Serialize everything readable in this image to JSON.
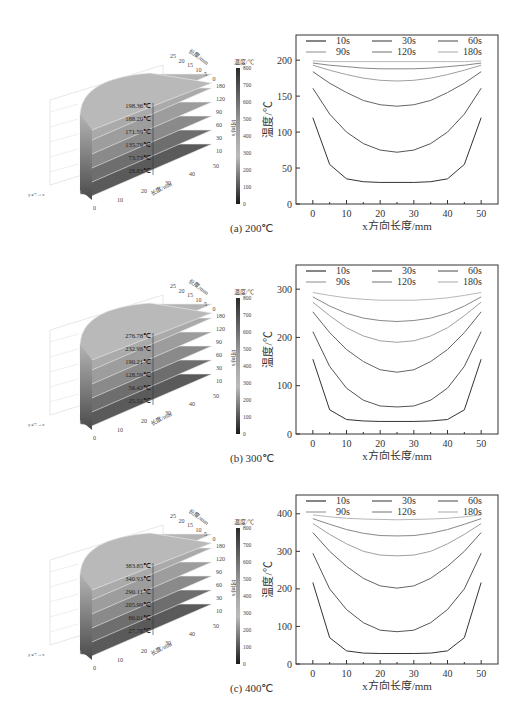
{
  "figure": {
    "panels": [
      {
        "id": "a",
        "caption": "(a) 200℃"
      },
      {
        "id": "b",
        "caption": "(b) 300℃"
      },
      {
        "id": "c",
        "caption": "(c) 400℃"
      }
    ]
  },
  "chart_data": [
    {
      "type": "line",
      "title": "(a) 200℃",
      "xlabel": "x方向长度/mm",
      "ylabel": "温度/℃",
      "xlim": [
        -5,
        55
      ],
      "ylim": [
        0,
        235
      ],
      "xticks": [
        0,
        10,
        20,
        30,
        40,
        50
      ],
      "yticks": [
        0,
        50,
        100,
        150,
        200
      ],
      "legend": [
        "10s",
        "30s",
        "60s",
        "90s",
        "120s",
        "180s"
      ],
      "x": [
        0,
        5,
        10,
        15,
        20,
        25,
        30,
        35,
        40,
        45,
        50
      ],
      "series": [
        {
          "name": "10s",
          "values": [
            120,
            55,
            35,
            31,
            30,
            30,
            30,
            31,
            35,
            55,
            120
          ]
        },
        {
          "name": "30s",
          "values": [
            161,
            125,
            100,
            84,
            75,
            72,
            75,
            84,
            100,
            125,
            161
          ]
        },
        {
          "name": "60s",
          "values": [
            184,
            168,
            155,
            144,
            138,
            136,
            138,
            144,
            155,
            168,
            184
          ]
        },
        {
          "name": "90s",
          "values": [
            193,
            186,
            180,
            175,
            172,
            171,
            172,
            175,
            180,
            186,
            193
          ]
        },
        {
          "name": "120s",
          "values": [
            196,
            193,
            191,
            189,
            188,
            188,
            188,
            189,
            191,
            193,
            196
          ]
        },
        {
          "name": "180s",
          "values": [
            199,
            198,
            198,
            198,
            198,
            198,
            198,
            198,
            198,
            198,
            199
          ]
        }
      ],
      "inset_3d": {
        "temperature_labels": [
          "198.36℃",
          "188.20℃",
          "171.59℃",
          "135.79℃",
          "73.73℃",
          "28.83℃"
        ],
        "time_axis_label": "时间/s",
        "time_ticks": [
          10,
          30,
          60,
          90,
          120,
          180
        ],
        "length_axis_label": "长度/mm",
        "length_ticks": [
          0,
          10,
          20,
          30,
          40,
          50
        ],
        "width_axis_label": "长度/mm",
        "width_ticks": [
          0,
          5,
          10,
          15,
          20,
          25
        ],
        "colorbar_label": "温度/℃",
        "colorbar_ticks": [
          0,
          100,
          200,
          300,
          400,
          500,
          600,
          700,
          800
        ]
      }
    },
    {
      "type": "line",
      "title": "(b) 300℃",
      "xlabel": "x方向长度/mm",
      "ylabel": "温度/℃",
      "xlim": [
        -5,
        55
      ],
      "ylim": [
        0,
        350
      ],
      "xticks": [
        0,
        10,
        20,
        30,
        40,
        50
      ],
      "yticks": [
        0,
        100,
        200,
        300
      ],
      "legend": [
        "10s",
        "30s",
        "60s",
        "90s",
        "120s",
        "180s"
      ],
      "x": [
        0,
        5,
        10,
        15,
        20,
        25,
        30,
        35,
        40,
        45,
        50
      ],
      "series": [
        {
          "name": "10s",
          "values": [
            155,
            50,
            30,
            27,
            26,
            26,
            26,
            27,
            30,
            50,
            155
          ]
        },
        {
          "name": "30s",
          "values": [
            212,
            140,
            95,
            70,
            58,
            56,
            58,
            70,
            95,
            140,
            212
          ]
        },
        {
          "name": "60s",
          "values": [
            253,
            210,
            175,
            150,
            133,
            128,
            133,
            150,
            175,
            210,
            253
          ]
        },
        {
          "name": "90s",
          "values": [
            273,
            245,
            220,
            203,
            193,
            190,
            193,
            203,
            220,
            245,
            273
          ]
        },
        {
          "name": "120s",
          "values": [
            284,
            265,
            250,
            240,
            235,
            233,
            235,
            240,
            250,
            265,
            284
          ]
        },
        {
          "name": "180s",
          "values": [
            293,
            287,
            282,
            279,
            277,
            277,
            277,
            279,
            282,
            287,
            293
          ]
        }
      ],
      "inset_3d": {
        "temperature_labels": [
          "276.78℃",
          "232.98℃",
          "190.21℃",
          "128.59℃",
          "56.42℃",
          "25.51℃"
        ],
        "time_axis_label": "时间/s",
        "time_ticks": [
          10,
          30,
          60,
          90,
          120,
          180
        ],
        "length_axis_label": "长度/mm",
        "length_ticks": [
          0,
          10,
          20,
          30,
          40,
          50
        ],
        "width_axis_label": "长度/mm",
        "width_ticks": [
          0,
          5,
          10,
          15,
          20,
          25
        ],
        "colorbar_label": "温度/℃",
        "colorbar_ticks": [
          0,
          100,
          200,
          300,
          400,
          500,
          600,
          700,
          800
        ]
      }
    },
    {
      "type": "line",
      "title": "(c) 400℃",
      "xlabel": "x方向长度/mm",
      "ylabel": "温度/℃",
      "xlim": [
        -5,
        55
      ],
      "ylim": [
        0,
        450
      ],
      "xticks": [
        0,
        10,
        20,
        30,
        40,
        50
      ],
      "yticks": [
        0,
        100,
        200,
        300,
        400
      ],
      "legend": [
        "10s",
        "30s",
        "60s",
        "90s",
        "120s",
        "180s"
      ],
      "x": [
        0,
        5,
        10,
        15,
        20,
        25,
        30,
        35,
        40,
        45,
        50
      ],
      "series": [
        {
          "name": "10s",
          "values": [
            217,
            70,
            35,
            29,
            28,
            28,
            28,
            29,
            35,
            70,
            217
          ]
        },
        {
          "name": "30s",
          "values": [
            295,
            200,
            145,
            110,
            90,
            86,
            90,
            110,
            145,
            200,
            295
          ]
        },
        {
          "name": "60s",
          "values": [
            350,
            300,
            260,
            228,
            208,
            202,
            208,
            228,
            260,
            300,
            350
          ]
        },
        {
          "name": "90s",
          "values": [
            374,
            345,
            320,
            300,
            290,
            288,
            290,
            300,
            320,
            345,
            374
          ]
        },
        {
          "name": "120s",
          "values": [
            387,
            372,
            358,
            348,
            342,
            341,
            342,
            348,
            358,
            372,
            387
          ]
        },
        {
          "name": "180s",
          "values": [
            397,
            392,
            388,
            386,
            385,
            384,
            385,
            386,
            388,
            392,
            397
          ]
        }
      ],
      "inset_3d": {
        "temperature_labels": [
          "383.85℃",
          "340.93℃",
          "290.11℃",
          "205.99℃",
          "86.01℃",
          "27.78℃"
        ],
        "time_axis_label": "时间/s",
        "time_ticks": [
          10,
          30,
          60,
          90,
          120,
          180
        ],
        "length_axis_label": "长度/mm",
        "length_ticks": [
          0,
          10,
          20,
          30,
          40,
          50
        ],
        "width_axis_label": "长度/mm",
        "width_ticks": [
          0,
          5,
          10,
          15,
          20,
          25
        ],
        "colorbar_label": "温度/℃",
        "colorbar_ticks": [
          0,
          100,
          200,
          300,
          400,
          500,
          600,
          700,
          800
        ]
      }
    }
  ],
  "colors": {
    "10s": "#333333",
    "30s": "#555555",
    "60s": "#666666",
    "90s": "#a0a0a0",
    "120s": "#888888",
    "180s": "#b8b8b8"
  }
}
